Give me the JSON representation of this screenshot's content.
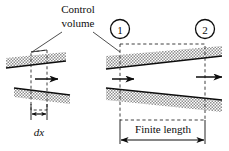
{
  "figure": {
    "type": "diagram",
    "background_color": "#ffffff",
    "ink_color": "#0d0d0d",
    "hatch_color": "#9a9a9a",
    "width": 229,
    "height": 151
  },
  "labels": {
    "control_volume_line1": "Control",
    "control_volume_line2": "volume",
    "dx": "dx",
    "finite_length": "Finite length",
    "station_1": "1",
    "station_2": "2"
  },
  "panels": [
    {
      "name": "differential-control-volume",
      "dimension_label": "dx",
      "boundary_style": "dashed",
      "flow_arrows": 1
    },
    {
      "name": "finite-control-volume",
      "dimension_label": "Finite length",
      "boundary_style": "dashed",
      "flow_arrows": 2,
      "inlet_station": "1",
      "outlet_station": "2"
    }
  ],
  "icons": {
    "flow_arrow": "right-arrow-icon",
    "dimension_arrow": "double-headed-arrow-icon",
    "leader": "leader-line-icon",
    "station_marker": "circled-number-icon"
  }
}
